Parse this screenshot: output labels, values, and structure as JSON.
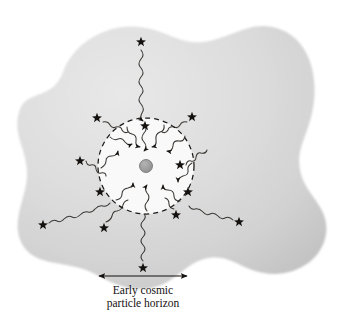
{
  "figure": {
    "caption_line_1": "Early cosmic",
    "caption_line_2": "particle horizon",
    "background_blob_label": "cosmic-medium-blob",
    "colors": {
      "page_background": "#ffffff",
      "blob_light": "#e2e2e2",
      "blob_mid": "#d4d4d4",
      "blob_dark": "#c2c2c2",
      "horizon_interior": "#fbfbfb",
      "ink": "#14110f",
      "wave_stroke": "#3a3734",
      "center_particle_fill": "#9a9a9a",
      "center_particle_stroke": "#6d6d6d",
      "dashed_circle_stroke": "#1d1a18"
    },
    "horizon_circle": {
      "name": "early-cosmic-particle-horizon-circle",
      "center_x": 146,
      "center_y": 166,
      "radius": 48,
      "stroke_dasharray": "5 4"
    },
    "center_particle": {
      "name": "central-observer-particle",
      "cx": 146,
      "cy": 166,
      "r": 6.5
    },
    "scale_bar": {
      "name": "horizon-scale-bar",
      "x1": 98,
      "x2": 188,
      "y": 276,
      "double_headed": true
    },
    "caption_position": {
      "x": 143,
      "y_line_1": 294,
      "y_line_2": 307
    },
    "inner_rays": [
      {
        "name": "inner-ray-n",
        "angle_deg": -90,
        "star_angle_deg": -76,
        "star_r": 41
      },
      {
        "name": "inner-ray-nne",
        "angle_deg": -64,
        "star_angle_deg": null,
        "star_r": null
      },
      {
        "name": "inner-ray-ne",
        "angle_deg": -34,
        "star_angle_deg": -26,
        "star_r": 45
      },
      {
        "name": "inner-ray-e",
        "angle_deg": -4,
        "star_angle_deg": 4,
        "star_r": 46
      },
      {
        "name": "inner-ray-sse",
        "angle_deg": 56,
        "star_angle_deg": 50,
        "star_r": 45
      },
      {
        "name": "inner-ray-s",
        "angle_deg": 92,
        "star_angle_deg": null,
        "star_r": null
      },
      {
        "name": "inner-ray-ssw",
        "angle_deg": 124,
        "star_angle_deg": null,
        "star_r": null
      },
      {
        "name": "inner-ray-w",
        "angle_deg": 176,
        "star_angle_deg": 178,
        "star_r": 46
      },
      {
        "name": "inner-ray-nw",
        "angle_deg": -146,
        "star_angle_deg": null,
        "star_r": null
      },
      {
        "name": "inner-ray-nnw",
        "angle_deg": -116,
        "star_angle_deg": null,
        "star_r": null
      }
    ],
    "outer_photons": [
      {
        "name": "outer-photon-north",
        "star_x": 141,
        "star_y": 42,
        "end_x": 144,
        "end_y": 114,
        "arrow": true
      },
      {
        "name": "outer-photon-northwest",
        "star_x": 97,
        "star_y": 118,
        "end_x": 117,
        "end_y": 134,
        "arrow": false
      },
      {
        "name": "outer-photon-northeast",
        "star_x": 192,
        "star_y": 117,
        "end_x": 175,
        "end_y": 134,
        "arrow": false
      },
      {
        "name": "outer-photon-west",
        "star_x": 80,
        "star_y": 161,
        "end_x": 100,
        "end_y": 164,
        "arrow": false
      },
      {
        "name": "outer-photon-east",
        "star_x": 180,
        "star_y": 165,
        "end_x": 196,
        "end_y": 167,
        "arrow": false
      },
      {
        "name": "outer-photon-southwest",
        "star_x": 43,
        "star_y": 225,
        "end_x": 101,
        "end_y": 195,
        "arrow": false
      },
      {
        "name": "outer-photon-southeast",
        "star_x": 239,
        "star_y": 222,
        "end_x": 190,
        "end_y": 196,
        "arrow": false
      },
      {
        "name": "outer-photon-south-left",
        "star_x": 104,
        "star_y": 228,
        "end_x": 122,
        "end_y": 200,
        "arrow": false
      },
      {
        "name": "outer-photon-south-right",
        "star_x": 176,
        "star_y": 215,
        "end_x": 170,
        "end_y": 200,
        "arrow": false
      },
      {
        "name": "outer-photon-south",
        "star_x": 143,
        "star_y": 268,
        "end_x": 145,
        "end_y": 216,
        "arrow": false
      }
    ],
    "inner_stars": [
      {
        "name": "inner-star-top",
        "x": 145,
        "y": 126
      }
    ],
    "rim_stars": [
      {
        "name": "rim-star-northwest",
        "x": 100,
        "y": 192
      },
      {
        "name": "rim-star-southeast",
        "x": 188,
        "y": 192
      }
    ]
  }
}
